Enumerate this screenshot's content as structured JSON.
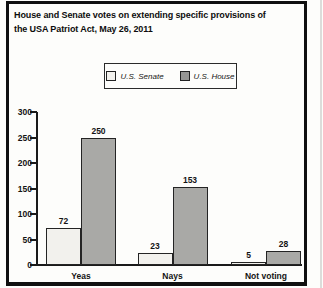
{
  "title": {
    "line1": "House and Senate votes on extending specific provisions of",
    "line2": "the USA Patriot Act, May 26, 2011"
  },
  "colors": {
    "senate_bar": "#f2f1ed",
    "house_bar": "#a9a9a6",
    "frame": "#101010"
  },
  "chart_data": {
    "type": "bar",
    "title": "House and Senate votes on extending specific provisions of the USA Patriot Act, May 26, 2011",
    "categories": [
      "Yeas",
      "Nays",
      "Not voting"
    ],
    "series": [
      {
        "name": "U.S. Senate",
        "values": [
          72,
          23,
          5
        ],
        "color": "#f2f1ed"
      },
      {
        "name": "U.S. House",
        "values": [
          250,
          153,
          28
        ],
        "color": "#a9a9a6"
      }
    ],
    "xlabel": "",
    "ylabel": "",
    "ylim": [
      0,
      300
    ],
    "yticks": [
      0,
      50,
      100,
      150,
      200,
      250,
      300
    ],
    "grid": false,
    "legend_position": "top",
    "value_labels": true
  }
}
